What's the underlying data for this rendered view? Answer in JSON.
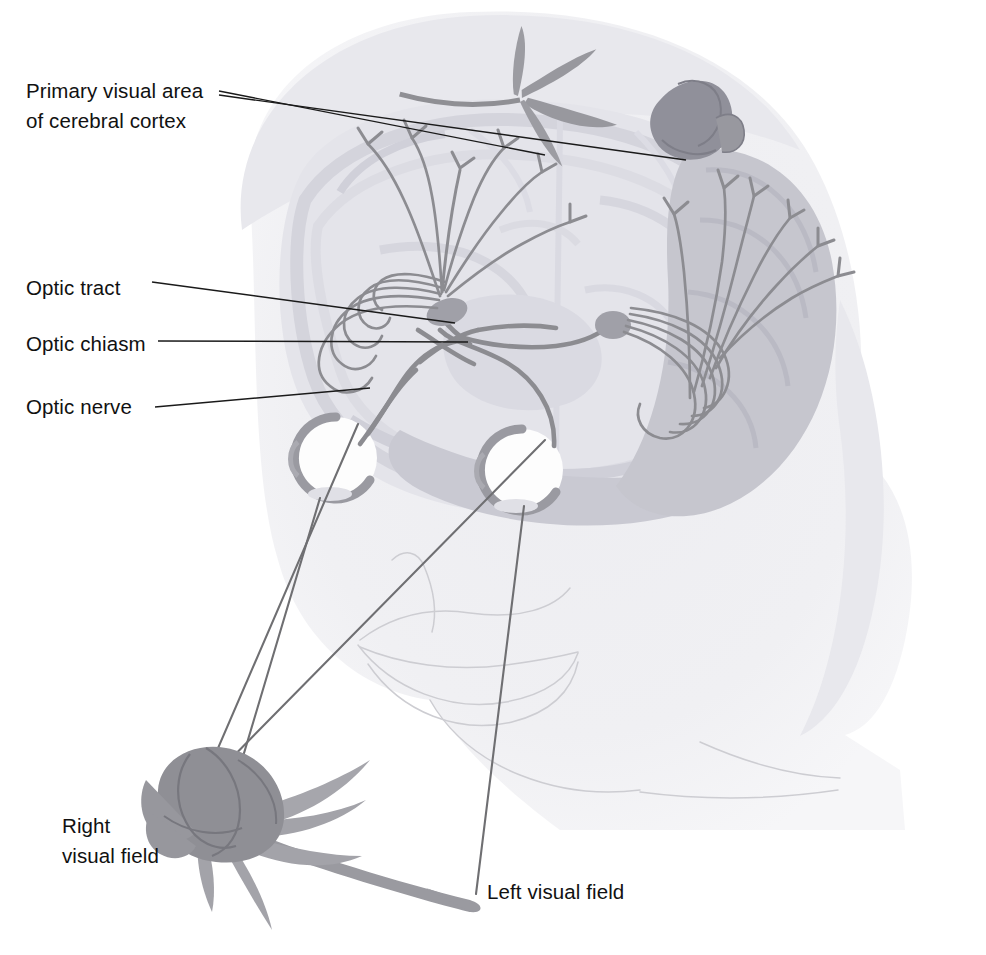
{
  "figure": {
    "background_color": "#ffffff",
    "label_color": "#111111",
    "head_color": "#eeeef1",
    "hair_color": "#e9e9ee",
    "brain_color": "#e2e2e7",
    "gyri_color": "#d2d2da",
    "cerebellum_color": "#c8c8d0",
    "nerve_color": "#8c8c91",
    "sight_line_color": "#6f6f72",
    "leader_line_color": "#1a1a1a",
    "rose_color": "#8f8f94",
    "sclera_color": "#fdfdfd"
  },
  "labels": {
    "primary_visual_area": {
      "line1": "Primary visual area",
      "line2": "of cerebral cortex",
      "x": 26,
      "y": 98
    },
    "optic_tract": {
      "text": "Optic tract",
      "x": 26,
      "y": 295
    },
    "optic_chiasm": {
      "text": "Optic chiasm",
      "x": 26,
      "y": 351
    },
    "optic_nerve": {
      "text": "Optic nerve",
      "x": 26,
      "y": 414
    },
    "right_visual_field": {
      "line1": "Right",
      "line2": "visual field",
      "x": 62,
      "y": 833
    },
    "left_visual_field": {
      "text": "Left visual field",
      "x": 487,
      "y": 899
    }
  },
  "structures": [
    {
      "name": "head-silhouette",
      "description": "profile of a head facing left with hair"
    },
    {
      "name": "cerebrum",
      "description": "brain viewed from above showing two hemispheres"
    },
    {
      "name": "cerebellum",
      "description": "darker lobed mass at the back of the brain"
    },
    {
      "name": "left-eyeball",
      "description": "eye on the viewer's left"
    },
    {
      "name": "right-eyeball",
      "description": "eye on the viewer's right"
    },
    {
      "name": "optic-nerve-pair",
      "description": "nerves running back from each eye"
    },
    {
      "name": "optic-chiasm",
      "description": "X crossing point of the two optic nerves"
    },
    {
      "name": "optic-tract-pair",
      "description": "tracts running to the lateral geniculate bodies"
    },
    {
      "name": "lateral-geniculate-body",
      "description": "relay nucleus on each side"
    },
    {
      "name": "optic-radiation",
      "description": "fanned fibres from geniculate body to cortex"
    },
    {
      "name": "visual-cortex-terminals",
      "description": "branching nerve endings in the occipital cortex"
    },
    {
      "name": "rose-object",
      "description": "rose held in the lower left, the viewed object"
    },
    {
      "name": "inverted-rose-image",
      "description": "reversed and inverted rose image at the cortex"
    },
    {
      "name": "sight-lines",
      "description": "four light rays from rose to the eyes"
    }
  ],
  "leaders": [
    {
      "name": "leader-primary-visual-left",
      "from": [
        219,
        91
      ],
      "to": [
        545,
        155
      ]
    },
    {
      "name": "leader-primary-visual-right",
      "from": [
        219,
        95
      ],
      "to": [
        686,
        160
      ]
    },
    {
      "name": "leader-optic-tract",
      "from": [
        152,
        282
      ],
      "to": [
        455,
        323
      ]
    },
    {
      "name": "leader-optic-chiasm",
      "from": [
        158,
        341
      ],
      "to": [
        468,
        342
      ]
    },
    {
      "name": "leader-optic-nerve",
      "from": [
        155,
        407
      ],
      "to": [
        370,
        388
      ]
    }
  ]
}
